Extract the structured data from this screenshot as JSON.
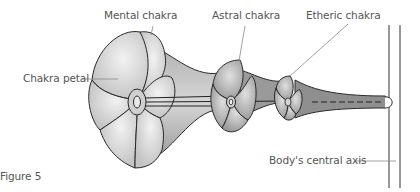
{
  "figure": {
    "caption": "Figure 5",
    "labels": {
      "mental": "Mental chakra",
      "astral": "Astral chakra",
      "etheric": "Etheric chakra",
      "petal": "Chakra petal",
      "axis": "Body's central axis"
    },
    "colors": {
      "fill_light": "#c9c9c9",
      "fill_mid": "#a9a9a9",
      "fill_dark": "#8c8c8c",
      "stroke": "#2a2a2a",
      "leader": "#8a8a8a"
    }
  }
}
